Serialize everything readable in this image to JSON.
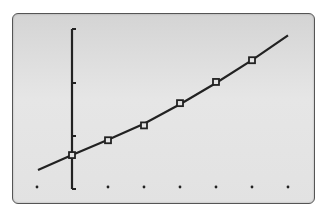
{
  "chart_data": {
    "type": "scatter",
    "title": "",
    "xlabel": "",
    "ylabel": "",
    "grid": false,
    "legend": "none",
    "xlim": [
      -1,
      6.5
    ],
    "ylim": [
      0,
      3
    ],
    "x_ticks": [
      -1,
      0,
      1,
      2,
      3,
      4,
      5,
      6
    ],
    "y_ticks": [
      0,
      1,
      2,
      3
    ],
    "series": [
      {
        "name": "data points",
        "marker": "hollow-square",
        "x": [
          0,
          1,
          2,
          3,
          4,
          5
        ],
        "y": [
          0.64,
          0.92,
          1.2,
          1.62,
          2.02,
          2.43
        ]
      },
      {
        "name": "regression curve",
        "style": "line",
        "x": [
          -1,
          0,
          1,
          2,
          3,
          4,
          5,
          6
        ],
        "y": [
          0.36,
          0.64,
          0.93,
          1.23,
          1.6,
          2.0,
          2.43,
          2.9
        ]
      }
    ]
  },
  "colors": {
    "screen_background": "#e0e0e0",
    "ink": "#222222",
    "frame": "#555555"
  }
}
